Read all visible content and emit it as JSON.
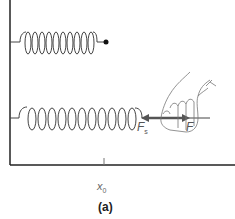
{
  "diagram": {
    "caption": "(a)",
    "position_label": {
      "symbol": "x",
      "subscript": "0"
    },
    "forces": {
      "spring_force": {
        "symbol": "F",
        "subscript": "s",
        "direction": "left"
      },
      "applied_force": {
        "symbol": "F",
        "direction": "right"
      }
    },
    "top_spring": {
      "state": "relaxed",
      "coils": 10,
      "end": "free dot"
    },
    "bottom_spring": {
      "state": "stretched",
      "coils": 11,
      "end": "held by hand"
    },
    "colors": {
      "line": "#444444",
      "wall": "#222222",
      "arrow": "#555555",
      "hand_outline": "#777777"
    }
  }
}
